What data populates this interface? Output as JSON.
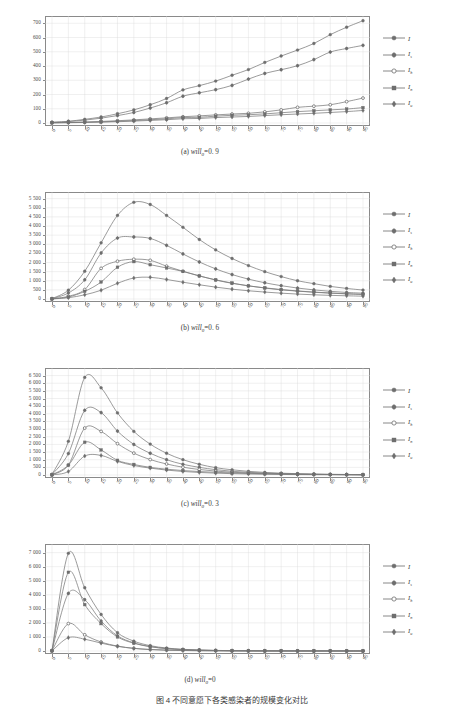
{
  "figure": {
    "caption": "图 4  不同意愿下各类感染者的规模变化对比",
    "xlabel": "",
    "ylabel": ""
  },
  "legend": {
    "position": "right",
    "entries": [
      {
        "label": "I",
        "sub": "",
        "marker": "filled-circle"
      },
      {
        "label": "I",
        "sub": "s",
        "marker": "filled-diamond-circle"
      },
      {
        "label": "I",
        "sub": "h",
        "marker": "open-circle"
      },
      {
        "label": "I",
        "sub": "n",
        "marker": "filled-square"
      },
      {
        "label": "I",
        "sub": "u",
        "marker": "filled-diamond"
      }
    ]
  },
  "colors": {
    "line": "#7a7a7a",
    "marker": "#6e6e6e",
    "frame": "#8a8a8a",
    "grid": "#d8d8d8",
    "text": "#3a3a3a"
  },
  "chart_data": [
    {
      "id": "a",
      "type": "line",
      "title": "(a) will0=0. 9",
      "caption_prefix": "(a)",
      "caption_var": "will",
      "caption_sub": "0",
      "caption_value": "=0. 9",
      "xlabel": "",
      "ylabel": "",
      "grid": true,
      "x": [
        0,
        5,
        10,
        15,
        20,
        25,
        30,
        35,
        40,
        45,
        50,
        55,
        60,
        65,
        70,
        75,
        80,
        85,
        90,
        95
      ],
      "xticklabels": [
        "0",
        "5",
        "10",
        "15",
        "20",
        "25",
        "30",
        "35",
        "40",
        "45",
        "50",
        "55",
        "60",
        "65",
        "70",
        "75",
        "80",
        "85",
        "90",
        "95"
      ],
      "ylim": [
        0,
        730
      ],
      "yticks": [
        0,
        100,
        200,
        300,
        400,
        500,
        600,
        700
      ],
      "yticklabels": [
        "0",
        "100",
        "200",
        "300",
        "400",
        "500",
        "600",
        "700"
      ],
      "series": [
        {
          "name": "I",
          "marker": "filled-circle",
          "values": [
            5,
            12,
            26,
            42,
            65,
            92,
            128,
            172,
            232,
            262,
            294,
            335,
            375,
            425,
            470,
            512,
            558,
            620,
            672,
            718
          ]
        },
        {
          "name": "Is",
          "marker": "filled-diamond-circle",
          "values": [
            4,
            10,
            20,
            34,
            52,
            74,
            105,
            142,
            188,
            212,
            234,
            264,
            308,
            348,
            374,
            402,
            445,
            498,
            523,
            545
          ]
        },
        {
          "name": "Ih",
          "marker": "open-circle",
          "values": [
            2,
            4,
            7,
            11,
            16,
            22,
            29,
            36,
            44,
            50,
            57,
            63,
            68,
            78,
            92,
            110,
            118,
            128,
            150,
            175
          ]
        },
        {
          "name": "In",
          "marker": "filled-square",
          "values": [
            2,
            3,
            5,
            8,
            12,
            17,
            23,
            29,
            38,
            40,
            48,
            54,
            58,
            64,
            72,
            80,
            86,
            92,
            98,
            108
          ]
        },
        {
          "name": "Iu",
          "marker": "filled-diamond",
          "values": [
            1,
            2,
            4,
            6,
            9,
            13,
            18,
            23,
            30,
            32,
            38,
            42,
            46,
            52,
            58,
            63,
            68,
            74,
            80,
            88
          ]
        }
      ]
    },
    {
      "id": "b",
      "type": "line",
      "title": "(b) will0=0. 6",
      "caption_prefix": "(b)",
      "caption_var": "will",
      "caption_sub": "0",
      "caption_value": "=0. 6",
      "xlabel": "",
      "ylabel": "",
      "grid": true,
      "x": [
        0,
        5,
        10,
        15,
        20,
        25,
        30,
        35,
        40,
        45,
        50,
        55,
        60,
        65,
        70,
        75,
        80,
        85,
        90,
        95
      ],
      "xticklabels": [
        "0",
        "5",
        "10",
        "15",
        "20",
        "25",
        "30",
        "35",
        "40",
        "45",
        "50",
        "55",
        "60",
        "65",
        "70",
        "75",
        "80",
        "85",
        "90",
        "95"
      ],
      "ylim": [
        0,
        5700
      ],
      "yticks": [
        0,
        500,
        1000,
        1500,
        2000,
        2500,
        3000,
        3500,
        4000,
        4500,
        5000,
        5500
      ],
      "yticklabels": [
        "0",
        "500",
        "1 000",
        "1 500",
        "2 000",
        "2 500",
        "3 000",
        "3 500",
        "4 000",
        "4 500",
        "5 000",
        "5 500"
      ],
      "series": [
        {
          "name": "I",
          "marker": "filled-circle",
          "values": [
            20,
            480,
            1520,
            3080,
            4580,
            5300,
            5180,
            4580,
            3930,
            3260,
            2690,
            2220,
            1830,
            1500,
            1230,
            1000,
            840,
            690,
            580,
            490
          ]
        },
        {
          "name": "Is",
          "marker": "filled-diamond-circle",
          "values": [
            15,
            330,
            1050,
            2520,
            3340,
            3400,
            3320,
            2940,
            2470,
            2030,
            1650,
            1340,
            1090,
            890,
            730,
            600,
            500,
            420,
            360,
            320
          ]
        },
        {
          "name": "Ih",
          "marker": "open-circle",
          "values": [
            10,
            150,
            520,
            1680,
            2070,
            2180,
            2120,
            1800,
            1520,
            1270,
            1040,
            860,
            720,
            600,
            500,
            430,
            370,
            320,
            280,
            250
          ]
        },
        {
          "name": "In",
          "marker": "filled-square",
          "values": [
            8,
            110,
            420,
            930,
            1740,
            2050,
            1880,
            1700,
            1510,
            1260,
            1050,
            870,
            720,
            610,
            520,
            440,
            380,
            330,
            290,
            255
          ]
        },
        {
          "name": "Iu",
          "marker": "filled-diamond",
          "values": [
            5,
            70,
            230,
            480,
            860,
            1150,
            1190,
            1070,
            920,
            780,
            650,
            540,
            450,
            380,
            320,
            270,
            230,
            200,
            175,
            155
          ]
        }
      ]
    },
    {
      "id": "c",
      "type": "line",
      "title": "(c) will0=0. 3",
      "caption_prefix": "(c)",
      "caption_var": "will",
      "caption_sub": "0",
      "caption_value": "=0. 3",
      "xlabel": "",
      "ylabel": "",
      "grid": true,
      "x": [
        0,
        5,
        10,
        15,
        20,
        25,
        30,
        35,
        40,
        45,
        50,
        55,
        60,
        65,
        70,
        75,
        80,
        85,
        90,
        95
      ],
      "xticklabels": [
        "0",
        "5",
        "10",
        "15",
        "20",
        "25",
        "30",
        "35",
        "40",
        "45",
        "50",
        "55",
        "60",
        "65",
        "70",
        "75",
        "80",
        "85",
        "90",
        "95"
      ],
      "ylim": [
        0,
        6800
      ],
      "yticks": [
        0,
        500,
        1000,
        1500,
        2000,
        2500,
        3000,
        3500,
        4000,
        4500,
        5000,
        5500,
        6000,
        6500
      ],
      "yticklabels": [
        "0",
        "500",
        "1 000",
        "1 500",
        "2 000",
        "2 500",
        "3 000",
        "3 500",
        "4 000",
        "4 500",
        "5 000",
        "5 500",
        "6 000",
        "6 500"
      ],
      "series": [
        {
          "name": "I",
          "marker": "filled-circle",
          "values": [
            30,
            2200,
            6380,
            5700,
            4060,
            2850,
            2020,
            1420,
            1000,
            700,
            480,
            340,
            240,
            170,
            120,
            85,
            60,
            45,
            35,
            25
          ]
        },
        {
          "name": "Is",
          "marker": "filled-diamond-circle",
          "values": [
            25,
            1400,
            4230,
            4080,
            2870,
            2000,
            1420,
            1000,
            700,
            500,
            350,
            245,
            175,
            125,
            90,
            65,
            48,
            36,
            28,
            20
          ]
        },
        {
          "name": "Ih",
          "marker": "open-circle",
          "values": [
            18,
            650,
            3070,
            2850,
            2050,
            1430,
            1010,
            720,
            510,
            360,
            255,
            180,
            130,
            95,
            70,
            50,
            38,
            29,
            22,
            16
          ]
        },
        {
          "name": "In",
          "marker": "filled-square",
          "values": [
            14,
            640,
            2140,
            1640,
            960,
            690,
            500,
            380,
            290,
            225,
            175,
            135,
            105,
            82,
            64,
            50,
            40,
            32,
            25,
            20
          ]
        },
        {
          "name": "Iu",
          "marker": "filled-diamond",
          "values": [
            8,
            230,
            1240,
            1280,
            890,
            620,
            450,
            320,
            230,
            165,
            120,
            88,
            64,
            47,
            35,
            26,
            20,
            15,
            12,
            9
          ]
        }
      ]
    },
    {
      "id": "d",
      "type": "line",
      "title": "(d) will0=0",
      "caption_prefix": "(d)",
      "caption_var": "will",
      "caption_sub": "0",
      "caption_value": "=0",
      "xlabel": "",
      "ylabel": "",
      "grid": true,
      "x": [
        0,
        5,
        10,
        15,
        20,
        25,
        30,
        35,
        40,
        45,
        50,
        55,
        60,
        65,
        70,
        75,
        80,
        85,
        90,
        95
      ],
      "xticklabels": [
        "0",
        "5",
        "10",
        "15",
        "20",
        "25",
        "30",
        "35",
        "40",
        "45",
        "50",
        "55",
        "60",
        "65",
        "70",
        "75",
        "80",
        "85",
        "90",
        "95"
      ],
      "ylim": [
        0,
        7400
      ],
      "yticks": [
        0,
        1000,
        2000,
        3000,
        4000,
        5000,
        6000,
        7000
      ],
      "yticklabels": [
        "0",
        "1 000",
        "2 000",
        "3 000",
        "4 000",
        "5 000",
        "6 000",
        "7 000"
      ],
      "series": [
        {
          "name": "I",
          "marker": "filled-circle",
          "values": [
            30,
            6950,
            4500,
            2600,
            1300,
            700,
            380,
            210,
            120,
            70,
            42,
            26,
            17,
            11,
            8,
            6,
            5,
            4,
            3,
            3
          ]
        },
        {
          "name": "Is",
          "marker": "filled-diamond-circle",
          "values": [
            25,
            4100,
            3650,
            2130,
            1080,
            580,
            320,
            175,
            100,
            58,
            35,
            22,
            14,
            9,
            7,
            5,
            4,
            3,
            3,
            2
          ]
        },
        {
          "name": "Ih",
          "marker": "open-circle",
          "values": [
            18,
            1950,
            1150,
            640,
            350,
            190,
            105,
            60,
            35,
            21,
            13,
            8,
            6,
            4,
            3,
            3,
            2,
            2,
            2,
            2
          ]
        },
        {
          "name": "In",
          "marker": "filled-square",
          "values": [
            14,
            5600,
            3300,
            1950,
            1000,
            550,
            300,
            170,
            100,
            60,
            37,
            23,
            15,
            10,
            7,
            6,
            5,
            4,
            3,
            3
          ]
        },
        {
          "name": "Iu",
          "marker": "filled-diamond",
          "values": [
            8,
            950,
            840,
            560,
            330,
            185,
            105,
            62,
            37,
            23,
            14,
            9,
            6,
            5,
            4,
            3,
            3,
            2,
            2,
            2
          ]
        }
      ]
    }
  ]
}
